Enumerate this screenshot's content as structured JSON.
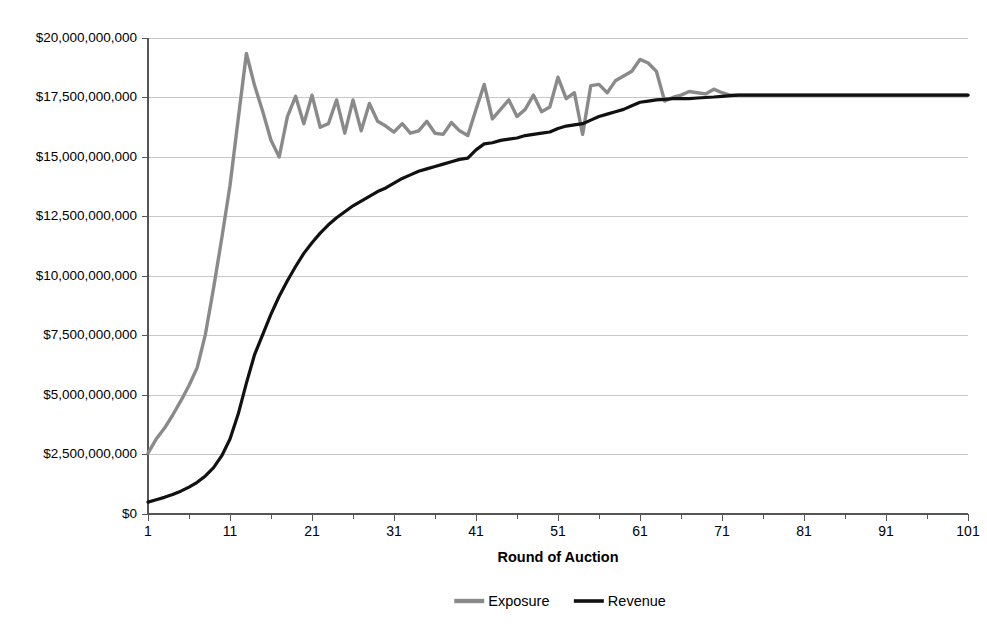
{
  "chart_data": {
    "type": "line",
    "title": "",
    "xlabel": "Round of Auction",
    "ylabel": "",
    "grid": true,
    "legend_position": "bottom",
    "xlim": [
      1,
      101
    ],
    "ylim": [
      0,
      20000000000
    ],
    "y_tick_step": 2500000000,
    "x_tick_step": 10,
    "x_minor_tick_step": 5,
    "x_tick_labels": [
      "1",
      "11",
      "21",
      "31",
      "41",
      "51",
      "61",
      "71",
      "81",
      "91",
      "101"
    ],
    "x_tick_values": [
      1,
      11,
      21,
      31,
      41,
      51,
      61,
      71,
      81,
      91,
      101
    ],
    "y_tick_labels": [
      "$20,000,000,000",
      "$17,500,000,000",
      "$15,000,000,000",
      "$12,500,000,000",
      "$10,000,000,000",
      "$7,500,000,000",
      "$5,000,000,000",
      "$2,500,000,000",
      "$0"
    ],
    "y_tick_values": [
      20000000000,
      17500000000,
      15000000000,
      12500000000,
      10000000000,
      7500000000,
      5000000000,
      2500000000,
      0
    ],
    "x": [
      1,
      2,
      3,
      4,
      5,
      6,
      7,
      8,
      9,
      10,
      11,
      12,
      13,
      14,
      15,
      16,
      17,
      18,
      19,
      20,
      21,
      22,
      23,
      24,
      25,
      26,
      27,
      28,
      29,
      30,
      31,
      32,
      33,
      34,
      35,
      36,
      37,
      38,
      39,
      40,
      41,
      42,
      43,
      44,
      45,
      46,
      47,
      48,
      49,
      50,
      51,
      52,
      53,
      54,
      55,
      56,
      57,
      58,
      59,
      60,
      61,
      62,
      63,
      64,
      65,
      66,
      67,
      68,
      69,
      70,
      71,
      72,
      73,
      74,
      75,
      76,
      77,
      78,
      79,
      80,
      81,
      82,
      83,
      84,
      85,
      86,
      87,
      88,
      89,
      90,
      91,
      92,
      93,
      94,
      95,
      96,
      97,
      98,
      99,
      100,
      101
    ],
    "series": [
      {
        "name": "Exposure",
        "color": "#8a8a8a",
        "stroke_width": 3.4,
        "values": [
          2560000000,
          3150000000,
          3600000000,
          4150000000,
          4750000000,
          5400000000,
          6150000000,
          7550000000,
          9500000000,
          11600000000,
          13800000000,
          16600000000,
          19350000000,
          18000000000,
          16900000000,
          15700000000,
          15000000000,
          16700000000,
          17550000000,
          16400000000,
          17600000000,
          16250000000,
          16400000000,
          17400000000,
          16000000000,
          17400000000,
          16100000000,
          17250000000,
          16500000000,
          16300000000,
          16050000000,
          16400000000,
          16000000000,
          16100000000,
          16500000000,
          16000000000,
          15950000000,
          16450000000,
          16100000000,
          15900000000,
          17000000000,
          18050000000,
          16600000000,
          17000000000,
          17400000000,
          16700000000,
          17000000000,
          17600000000,
          16900000000,
          17100000000,
          18350000000,
          17450000000,
          17700000000,
          15950000000,
          18000000000,
          18050000000,
          17700000000,
          18200000000,
          18400000000,
          18600000000,
          19100000000,
          18950000000,
          18600000000,
          17350000000,
          17500000000,
          17600000000,
          17750000000,
          17700000000,
          17650000000,
          17850000000,
          17700000000,
          17600000000,
          17600000000,
          17600000000,
          17600000000,
          17600000000,
          17600000000,
          17600000000,
          17600000000,
          17600000000,
          17600000000,
          17600000000,
          17600000000,
          17600000000,
          17600000000,
          17600000000,
          17600000000,
          17600000000,
          17600000000,
          17600000000,
          17600000000,
          17600000000,
          17600000000,
          17600000000,
          17600000000,
          17600000000,
          17600000000,
          17600000000,
          17600000000,
          17600000000,
          17600000000
        ]
      },
      {
        "name": "Revenue",
        "color": "#111111",
        "stroke_width": 3.2,
        "values": [
          500000000,
          600000000,
          700000000,
          820000000,
          960000000,
          1130000000,
          1330000000,
          1600000000,
          1950000000,
          2450000000,
          3150000000,
          4200000000,
          5500000000,
          6700000000,
          7550000000,
          8400000000,
          9150000000,
          9800000000,
          10400000000,
          10950000000,
          11400000000,
          11800000000,
          12150000000,
          12450000000,
          12700000000,
          12950000000,
          13150000000,
          13350000000,
          13550000000,
          13700000000,
          13900000000,
          14100000000,
          14250000000,
          14400000000,
          14500000000,
          14600000000,
          14700000000,
          14800000000,
          14900000000,
          14950000000,
          15300000000,
          15550000000,
          15600000000,
          15700000000,
          15750000000,
          15800000000,
          15900000000,
          15950000000,
          16000000000,
          16050000000,
          16200000000,
          16300000000,
          16350000000,
          16400000000,
          16550000000,
          16700000000,
          16800000000,
          16900000000,
          17000000000,
          17150000000,
          17300000000,
          17350000000,
          17400000000,
          17420000000,
          17450000000,
          17450000000,
          17450000000,
          17480000000,
          17500000000,
          17520000000,
          17550000000,
          17580000000,
          17600000000,
          17600000000,
          17600000000,
          17600000000,
          17600000000,
          17600000000,
          17600000000,
          17600000000,
          17600000000,
          17600000000,
          17600000000,
          17600000000,
          17600000000,
          17600000000,
          17600000000,
          17600000000,
          17600000000,
          17600000000,
          17600000000,
          17600000000,
          17600000000,
          17600000000,
          17600000000,
          17600000000,
          17600000000,
          17600000000,
          17600000000,
          17600000000,
          17600000000
        ]
      }
    ]
  },
  "legend": {
    "items": [
      {
        "label": "Exposure",
        "color": "#8a8a8a"
      },
      {
        "label": "Revenue",
        "color": "#111111"
      }
    ]
  },
  "axis": {
    "x_title": "Round of Auction"
  }
}
